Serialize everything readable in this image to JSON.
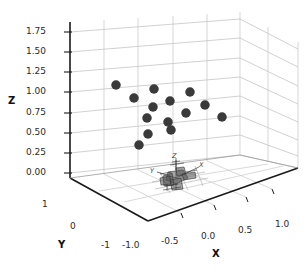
{
  "figure": {
    "background": "#ffffff",
    "pane_color": "#ffffff",
    "grid_color": "#b8b8b8",
    "axis_line_color": "#1a1a1a",
    "marker_color": "#3a3a3a",
    "marker_size_px": 9.5
  },
  "axes": {
    "z": {
      "title": "Z",
      "ticks": [
        "0.00",
        "0.25",
        "0.50",
        "0.75",
        "1.00",
        "1.25",
        "1.50",
        "1.75"
      ],
      "values": [
        0.0,
        0.25,
        0.5,
        0.75,
        1.0,
        1.25,
        1.5,
        1.75
      ],
      "lim": [
        0.0,
        1.875
      ]
    },
    "x": {
      "title": "X",
      "ticks": [
        "-1.0",
        "-0.5",
        "0.0",
        "0.5",
        "1.0"
      ],
      "values": [
        -1.0,
        -0.5,
        0.0,
        0.5,
        1.0
      ],
      "lim": [
        -1.25,
        1.1
      ]
    },
    "y": {
      "title": "Y",
      "ticks": [
        "1",
        "0",
        "-1"
      ],
      "values": [
        1,
        0,
        -1
      ],
      "lim": [
        -1.25,
        1.25
      ]
    }
  },
  "mini_frame": {
    "labels": [
      "Z",
      "Y",
      "X"
    ],
    "description": "small-3d-mesh-with-axis-triad"
  },
  "chart_data": {
    "type": "scatter",
    "title": "",
    "xlabel": "X",
    "ylabel": "Y",
    "zlabel": "Z",
    "xlim": [
      -1.25,
      1.1
    ],
    "ylim": [
      -1.25,
      1.25
    ],
    "zlim": [
      0.0,
      1.875
    ],
    "grid": true,
    "legend": false,
    "projection": "3d",
    "series": [
      {
        "name": "points",
        "color": "#3a3a3a",
        "marker": "o",
        "points": [
          {
            "px": 116,
            "py": 85,
            "x": -1.02,
            "y": 0.62,
            "z": 1.09
          },
          {
            "px": 134,
            "py": 98,
            "x": -0.86,
            "y": 0.28,
            "z": 0.94
          },
          {
            "px": 154,
            "py": 89,
            "x": -0.62,
            "y": 0.42,
            "z": 1.04
          },
          {
            "px": 153,
            "py": 107,
            "x": -0.64,
            "y": 0.1,
            "z": 0.77
          },
          {
            "px": 170,
            "py": 101,
            "x": -0.44,
            "y": 0.18,
            "z": 0.88
          },
          {
            "px": 190,
            "py": 92,
            "x": -0.2,
            "y": 0.38,
            "z": 0.99
          },
          {
            "px": 186,
            "py": 113,
            "x": -0.25,
            "y": -0.02,
            "z": 0.74
          },
          {
            "px": 205,
            "py": 105,
            "x": 0.0,
            "y": 0.12,
            "z": 0.83
          },
          {
            "px": 222,
            "py": 117,
            "x": 0.22,
            "y": -0.08,
            "z": 0.68
          },
          {
            "px": 168,
            "py": 122,
            "x": -0.46,
            "y": -0.2,
            "z": 0.63
          },
          {
            "px": 148,
            "py": 134,
            "x": -0.7,
            "y": -0.38,
            "z": 0.47
          },
          {
            "px": 139,
            "py": 145,
            "x": -0.82,
            "y": -0.55,
            "z": 0.32
          },
          {
            "px": 147,
            "py": 118,
            "x": -0.72,
            "y": -0.12,
            "z": 0.7
          },
          {
            "px": 171,
            "py": 130,
            "x": -0.42,
            "y": -0.32,
            "z": 0.55
          }
        ]
      }
    ]
  }
}
